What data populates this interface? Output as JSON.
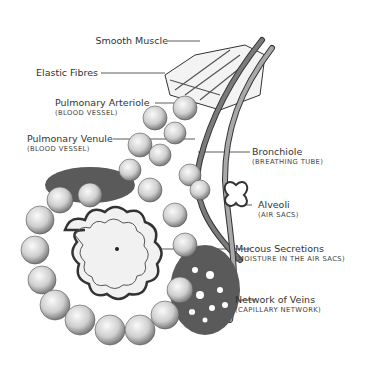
{
  "diagram": {
    "labels": [
      {
        "id": "smooth-muscle",
        "name": "Smooth Muscle",
        "sub": ""
      },
      {
        "id": "elastic-fibres",
        "name": "Elastic Fibres",
        "sub": ""
      },
      {
        "id": "pulmonary-arteriole",
        "name": "Pulmonary Arteriole",
        "sub": "(BLOOD VESSEL)"
      },
      {
        "id": "pulmonary-venule",
        "name": "Pulmonary Venule",
        "sub": "(BLOOD VESSEL)"
      },
      {
        "id": "bronchiole",
        "name": "Bronchiole",
        "sub": "(BREATHING TUBE)"
      },
      {
        "id": "alveoli",
        "name": "Alveoli",
        "sub": "(AIR SACS)"
      },
      {
        "id": "mucous-secretions",
        "name": "Mucous Secretions",
        "sub": "(MOISTURE IN THE AIR SACS)"
      },
      {
        "id": "network-of-veins",
        "name": "Network of Veins",
        "sub": "(CAPILLARY NETWORK)"
      }
    ],
    "colors": {
      "ink": "#333333",
      "vessel": "#6e6e6e",
      "sac": "#d8d8d8"
    }
  }
}
